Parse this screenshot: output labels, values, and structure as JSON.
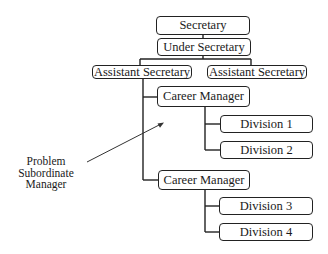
{
  "diagram": {
    "type": "org-chart",
    "nodes": {
      "secretary": "Secretary",
      "under_secretary": "Under Secretary",
      "assistant_secretary_1": "Assistant Secretary",
      "assistant_secretary_2": "Assistant Secretary",
      "career_manager_1": "Career Manager",
      "career_manager_2": "Career Manager",
      "division_1": "Division 1",
      "division_2": "Division 2",
      "division_3": "Division 3",
      "division_4": "Division 4"
    },
    "annotation": {
      "lines": [
        "Problem",
        "Subordinate",
        "Manager"
      ]
    },
    "edges": [
      [
        "secretary",
        "under_secretary"
      ],
      [
        "under_secretary",
        "assistant_secretary_1"
      ],
      [
        "under_secretary",
        "assistant_secretary_2"
      ],
      [
        "assistant_secretary_1",
        "career_manager_1"
      ],
      [
        "assistant_secretary_1",
        "career_manager_2"
      ],
      [
        "career_manager_1",
        "division_1"
      ],
      [
        "career_manager_1",
        "division_2"
      ],
      [
        "career_manager_2",
        "division_3"
      ],
      [
        "career_manager_2",
        "division_4"
      ]
    ]
  }
}
